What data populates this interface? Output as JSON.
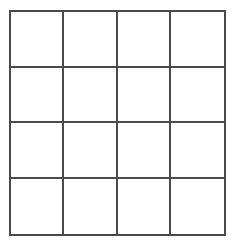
{
  "diagram": {
    "type": "grid",
    "rows": 4,
    "columns": 4,
    "line_color": "#4a4a4a",
    "background_color": "#ffffff",
    "cells": [
      [
        "",
        "",
        "",
        ""
      ],
      [
        "",
        "",
        "",
        ""
      ],
      [
        "",
        "",
        "",
        ""
      ],
      [
        "",
        "",
        "",
        ""
      ]
    ]
  }
}
